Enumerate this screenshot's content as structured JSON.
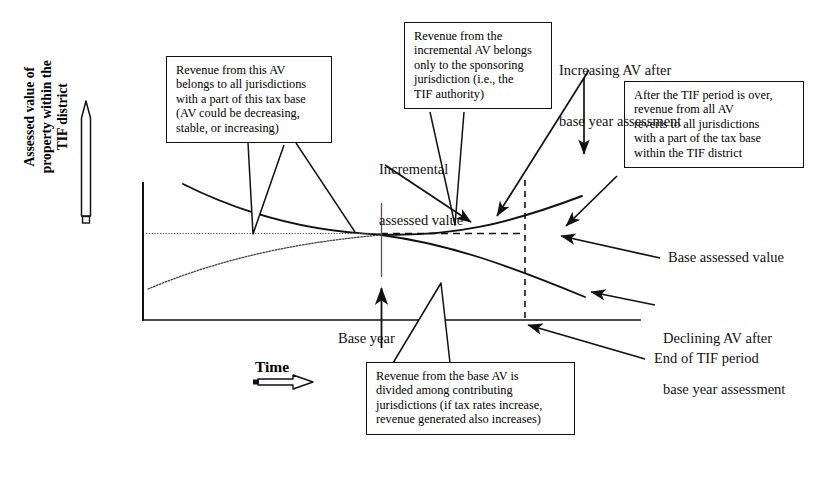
{
  "diagram": {
    "type": "conceptual-line-diagram",
    "axes": {
      "y_label_lines": [
        "Assessed value of",
        "property within the",
        "TIF district"
      ],
      "x_label": "Time",
      "y_arrow": "up-arrow",
      "x_arrow": "right-arrow"
    },
    "inline_labels": [
      {
        "name": "incremental-assessed-value",
        "lines": [
          "Incremental",
          "assessed value"
        ]
      },
      {
        "name": "base-year",
        "lines": [
          "Base year"
        ]
      },
      {
        "name": "increasing-av",
        "lines": [
          "Increasing AV after",
          "base year assessment"
        ]
      },
      {
        "name": "base-assessed-value",
        "lines": [
          "Base assessed value"
        ]
      },
      {
        "name": "declining-av",
        "lines": [
          "Declining AV after",
          "base year assessment"
        ]
      },
      {
        "name": "end-of-tif-period",
        "lines": [
          "End of TIF period"
        ]
      }
    ],
    "callouts": [
      {
        "name": "callout-total-av",
        "lines": [
          "Revenue from this AV",
          "belongs to all jurisdictions",
          "with a part of this tax base",
          "(AV could be decreasing,",
          "stable, or increasing)"
        ]
      },
      {
        "name": "callout-incremental-av",
        "lines": [
          "Revenue from the",
          "incremental AV belongs",
          "only to the sponsoring",
          "jurisdiction (i.e., the",
          "TIF authority)"
        ]
      },
      {
        "name": "callout-after-tif",
        "lines": [
          "After the TIF period is over,",
          "revenue from all AV",
          "reverts to all jurisdictions",
          "with a part of the tax base",
          "within the TIF district"
        ]
      },
      {
        "name": "callout-base-av",
        "lines": [
          "Revenue from the base AV is",
          "divided among contributing",
          "jurisdictions (if tax rates increase,",
          "revenue generated also increases)"
        ]
      }
    ],
    "colors": {
      "ink": "#111111",
      "background": "#ffffff",
      "dotted": "#555555"
    }
  }
}
